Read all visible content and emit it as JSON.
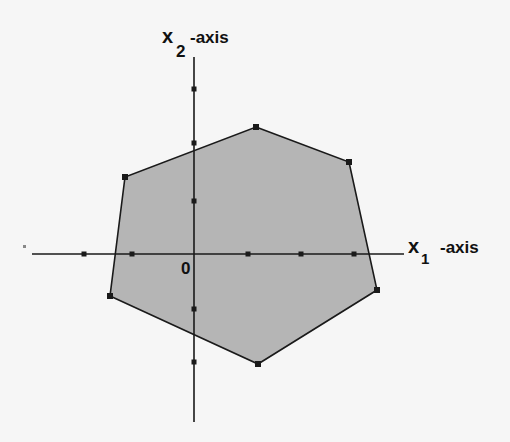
{
  "figure": {
    "type": "feasible-region-diagram",
    "background_color": "#f6f6f6",
    "region_fill_color": "#b5b5b5",
    "line_color": "#1a1a1a"
  },
  "axes": {
    "x_axis": {
      "label_main": "x",
      "label_subscript": "1",
      "label_suffix": "-axis",
      "start": [
        32,
        254
      ],
      "end": [
        404,
        254
      ],
      "ticks_px": [
        84,
        132,
        248,
        301,
        354
      ]
    },
    "y_axis": {
      "label_main": "x",
      "label_subscript": "2",
      "label_suffix": "-axis",
      "start": [
        194,
        57
      ],
      "end": [
        194,
        422
      ],
      "ticks_px": [
        89,
        143,
        201,
        309,
        362
      ]
    },
    "origin_label": "0"
  },
  "region": {
    "name": "hexagonal feasible region",
    "vertices_px": [
      [
        256,
        127
      ],
      [
        349,
        162
      ],
      [
        377,
        290
      ],
      [
        258,
        364
      ],
      [
        110,
        296
      ],
      [
        125,
        177
      ]
    ]
  },
  "chart_data": {
    "type": "area",
    "title": "",
    "xlabel": "x1-axis",
    "ylabel": "x2-axis",
    "polygon_vertices_units": [
      [
        1.2,
        2.3
      ],
      [
        2.9,
        1.7
      ],
      [
        3.4,
        -0.7
      ],
      [
        1.2,
        -2.1
      ],
      [
        -1.5,
        -0.8
      ],
      [
        -1.3,
        1.4
      ]
    ],
    "x_ticks_units": [
      -2,
      -1,
      1,
      2,
      3
    ],
    "y_ticks_units": [
      3,
      2,
      1,
      -1,
      -2
    ],
    "origin": [
      0,
      0
    ],
    "grid": false,
    "legend": null
  }
}
